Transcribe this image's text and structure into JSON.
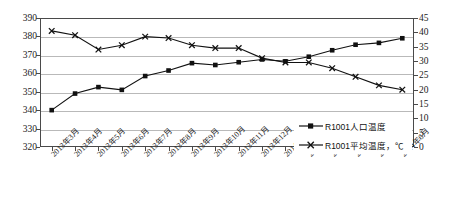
{
  "chart_data": {
    "type": "line",
    "title": "",
    "xlabel": "",
    "ylabel": "",
    "y2label": "",
    "grid": true,
    "legend_position": "inside-bottom-right",
    "categories": [
      "2013年3月",
      "2013年4月",
      "2013年5月",
      "2013年6月",
      "2013年7月",
      "2013年8月",
      "2013年9月",
      "2013年10月",
      "2013年11月",
      "2013年12月",
      "2014年1月",
      "2014年2月",
      "2014年3月",
      "2014年4月",
      "2014年5月",
      "2014年6月"
    ],
    "yticks_left": [
      "320",
      "330",
      "340",
      "350",
      "360",
      "370",
      "380",
      "390"
    ],
    "yticks_right": [
      "0",
      "5",
      "10",
      "15",
      "20",
      "25",
      "30",
      "35",
      "40",
      "45"
    ],
    "ylim": [
      320,
      390
    ],
    "y2lim": [
      0,
      45
    ],
    "series": [
      {
        "name": "R1001人口温度",
        "axis": "left",
        "marker": "square",
        "values": [
          340,
          349,
          352.5,
          351,
          358.5,
          361.5,
          365.5,
          364.5,
          366,
          367.5,
          366.5,
          369,
          372.5,
          375.5,
          376.5,
          379
        ]
      },
      {
        "name": "R1001平均温度，℃",
        "axis": "right",
        "marker": "cross",
        "values": [
          40.5,
          39,
          34,
          35.5,
          38.5,
          38,
          35.5,
          34.5,
          34.5,
          31,
          29.5,
          29.5,
          27.5,
          24.5,
          21.5,
          20
        ]
      }
    ],
    "legend": [
      {
        "label": "R1001人口温度",
        "marker": "square"
      },
      {
        "label": "R1001平均温度，℃",
        "marker": "cross"
      }
    ]
  }
}
